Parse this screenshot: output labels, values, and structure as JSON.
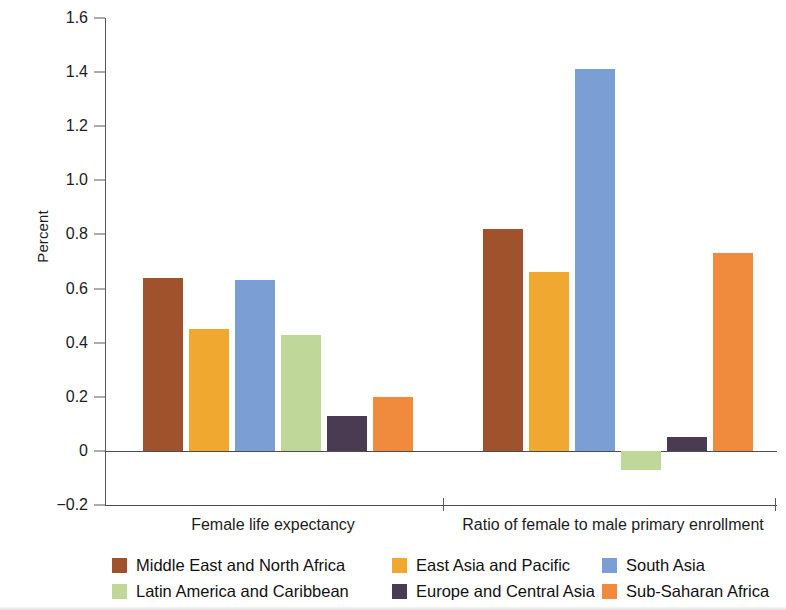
{
  "chart_data": {
    "type": "bar",
    "title": "",
    "subtitle": "",
    "xlabel": "",
    "ylabel": "Percent",
    "categories": [
      "Female life expectancy",
      "Ratio of female to male primary enrollment"
    ],
    "series": [
      {
        "name": "Middle East and North Africa",
        "color": "#a0522d",
        "values": [
          0.64,
          0.82
        ]
      },
      {
        "name": "East Asia and Pacific",
        "color": "#f0a830",
        "values": [
          0.45,
          0.66
        ]
      },
      {
        "name": "South Asia",
        "color": "#7b9ed4",
        "values": [
          0.63,
          1.41
        ]
      },
      {
        "name": "Latin America and Caribbean",
        "color": "#c0d79a",
        "values": [
          0.43,
          -0.07
        ]
      },
      {
        "name": "Europe and Central Asia",
        "color": "#4a3b53",
        "values": [
          0.13,
          0.05
        ]
      },
      {
        "name": "Sub-Saharan Africa",
        "color": "#f08a3c",
        "values": [
          0.2,
          0.73
        ]
      }
    ],
    "ylim": [
      -0.2,
      1.6
    ],
    "yticks": [
      1.6,
      1.4,
      1.2,
      1.0,
      0.8,
      0.6,
      0.4,
      0.2,
      0,
      -0.2
    ],
    "ytick_labels": [
      "1.6",
      "1.4",
      "1.2",
      "1.0",
      "0.8",
      "0.6",
      "0.4",
      "0.2",
      "0",
      "−0.2"
    ],
    "grid": false,
    "gridlines_shown": [
      "0",
      "-0.2"
    ],
    "legend_position": "bottom",
    "legend_columns": 3,
    "legend_rows": 2,
    "axis_color": "#58585a"
  }
}
